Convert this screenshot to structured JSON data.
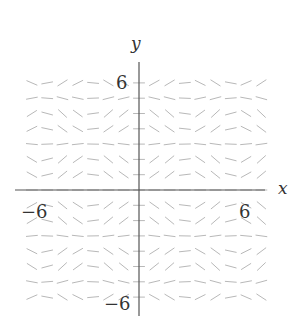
{
  "diagram": {
    "type": "slope-field",
    "axes": {
      "x_label": "x",
      "y_label": "y",
      "tick_labels": {
        "x_pos": "6",
        "x_neg": "−6",
        "y_pos": "6",
        "y_neg": "−6"
      }
    },
    "grid": {
      "x_range": [
        -7.5,
        7.5
      ],
      "y_range": [
        -7.5,
        7.5
      ],
      "step": 1,
      "offset": 0.5,
      "slope_function": "sin(x)*sin(y)"
    },
    "colors": {
      "axis": "#555555",
      "segment": "#b8b8b8",
      "label": "#333333"
    }
  }
}
